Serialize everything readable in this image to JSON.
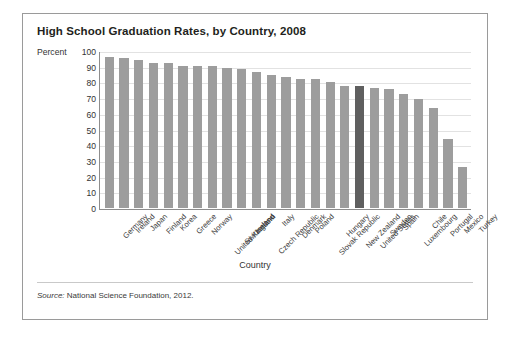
{
  "figure": {
    "title": "High School Graduation Rates, by Country, 2008",
    "y_axis_title": "Percent",
    "x_axis_title": "Country",
    "source_prefix": "Source:",
    "source_text": " National Science Foundation, 2012."
  },
  "colors": {
    "bar": "#9d9d9d",
    "bar_highlight": "#5f5f5f",
    "gridline": "#e2e2e2",
    "axis": "#8d8d8d",
    "frame": "#9a9a9a",
    "text": "#231f20"
  },
  "chart_data": {
    "type": "bar",
    "title": "High School Graduation Rates, by Country, 2008",
    "xlabel": "Country",
    "ylabel": "Percent",
    "ylim": [
      0,
      100
    ],
    "ytick_labels": [
      "100",
      "90",
      "80",
      "70",
      "60",
      "50",
      "40",
      "30",
      "20",
      "10",
      "0"
    ],
    "yticks": [
      100,
      90,
      80,
      70,
      60,
      50,
      40,
      30,
      20,
      10,
      0
    ],
    "grid": "horizontal",
    "legend": "none",
    "highlighted_category": "United States",
    "categories": [
      "Germany",
      "Ireland",
      "Japan",
      "Finland",
      "Korea",
      "Greece",
      "Norway",
      "United Kingdom",
      "Switzerland",
      "Iceland",
      "Czech Republic",
      "Italy",
      "Denmark",
      "Poland",
      "Slovak Republic",
      "Hungary",
      "New Zealand",
      "United States",
      "Sweden",
      "Spain",
      "Luxembourg",
      "Chile",
      "Portugal",
      "Mexico",
      "Turkey"
    ],
    "values": [
      97,
      96,
      95,
      93,
      93,
      91,
      91,
      91,
      90,
      89,
      87,
      85,
      84,
      83,
      83,
      81,
      78,
      78,
      77,
      76,
      73,
      70,
      64,
      44,
      26
    ]
  }
}
